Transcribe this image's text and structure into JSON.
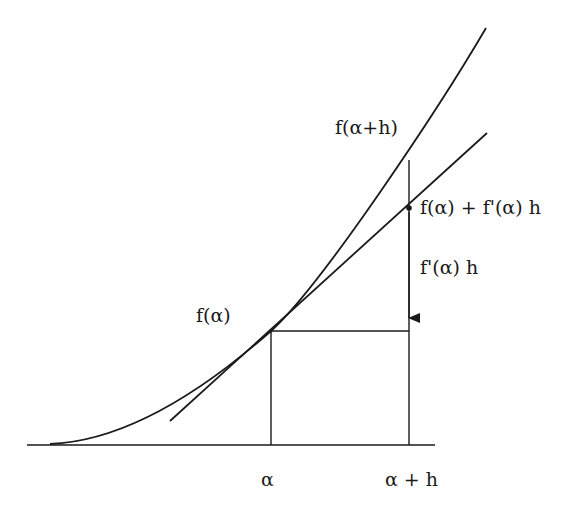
{
  "diagram": {
    "colors": {
      "ink": "#1a1a1a",
      "background": "#ffffff"
    },
    "labels": {
      "f_alpha": "f(α)",
      "f_alpha_plus_h": "f(α+h)",
      "tangent_value": "f(α) + f'(α) h",
      "increment": "f'(α) h",
      "x_alpha": "α",
      "x_alpha_plus_h": "α + h"
    },
    "elements": {
      "x_axis": {
        "from": [
          27,
          445
        ],
        "to": [
          435,
          445
        ]
      },
      "curve": {
        "start": [
          50,
          444
        ],
        "tangent_point": [
          271,
          331
        ],
        "through": [
          409,
          160
        ],
        "end": [
          486,
          28
        ]
      },
      "tangent_line": {
        "from": [
          170,
          421
        ],
        "to": [
          487,
          133
        ]
      },
      "vertical_at_alpha": {
        "x": 271,
        "y_top": 331,
        "y_bottom": 445
      },
      "vertical_at_alpha_plus_h": {
        "x": 409,
        "y_top": 160,
        "y_bottom": 445
      },
      "horizontal_from_f_alpha": {
        "y": 331,
        "x_from": 271,
        "x_to": 409
      },
      "increment_arrow": {
        "x": 409,
        "from_y": 208,
        "to_y": 331
      }
    }
  }
}
